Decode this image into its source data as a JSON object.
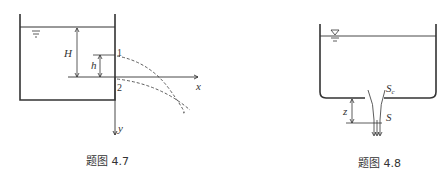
{
  "figures": [
    {
      "caption": "题图 4.7",
      "labels": {
        "H": "H",
        "h": "h",
        "p1": "1",
        "p2": "2",
        "x": "x",
        "y": "y"
      }
    },
    {
      "caption": "题图 4.8",
      "labels": {
        "z": "z",
        "Sc": "S",
        "Sc_sub": "c",
        "S": "S"
      }
    }
  ]
}
